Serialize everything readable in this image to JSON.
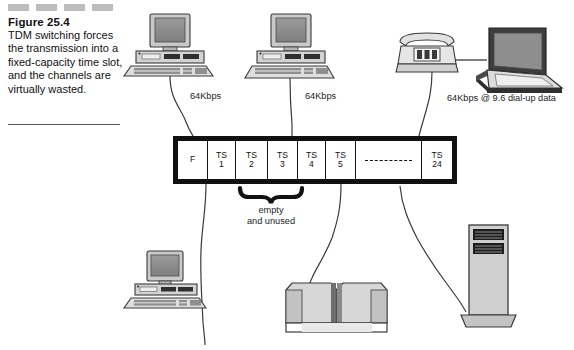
{
  "figure": {
    "number": "Figure 25.4",
    "caption": "TDM switching forces the transmission into a fixed-capacity time slot, and the channels are virtually wasted."
  },
  "frame": {
    "name": "TDM frame",
    "cells": [
      {
        "top": "F",
        "bottom": ""
      },
      {
        "top": "TS",
        "bottom": "1"
      },
      {
        "top": "TS",
        "bottom": "2"
      },
      {
        "top": "TS",
        "bottom": "3"
      },
      {
        "top": "TS",
        "bottom": "4"
      },
      {
        "top": "TS",
        "bottom": "5"
      },
      {
        "top": "",
        "bottom": ""
      },
      {
        "top": "TS",
        "bottom": "24"
      }
    ]
  },
  "annotations": {
    "rate_1": "64Kbps",
    "rate_2": "64Kbps",
    "rate_3": "64Kbps @ 9.6 dial-up data",
    "empty_line_1": "empty",
    "empty_line_2": "and unused"
  },
  "devices": {
    "pc_top_left": "desktop-computer",
    "pc_top_center": "desktop-computer",
    "telephone": "telephone",
    "laptop": "laptop-computer",
    "pc_bottom_left": "desktop-computer",
    "mainframe": "mainframe-cabinet",
    "tower_server": "tower-server"
  },
  "colors": {
    "ink": "#111111",
    "screen_gray": "#8a8a8a",
    "body_gray": "#c9c9c9",
    "dash_gray": "#bdbdbd",
    "dark_gray": "#5a5a5a"
  }
}
